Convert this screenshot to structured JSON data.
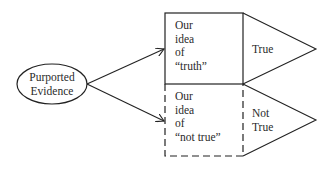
{
  "diagram": {
    "source_node": {
      "lines": [
        "Purported",
        "Evidence"
      ]
    },
    "boxes": [
      {
        "lines": [
          "Our",
          "idea",
          "of",
          "“truth”"
        ],
        "border": "solid"
      },
      {
        "lines": [
          "Our",
          "idea",
          "of",
          "“not true”"
        ],
        "border": "dashed"
      }
    ],
    "outcomes": [
      {
        "lines": [
          "True"
        ]
      },
      {
        "lines": [
          "Not",
          "True"
        ]
      }
    ],
    "colors": {
      "stroke": "#222222",
      "background": "#ffffff"
    }
  }
}
